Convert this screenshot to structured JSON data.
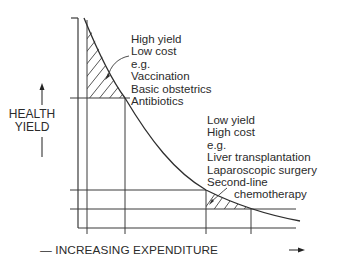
{
  "diagram": {
    "type": "cost-effectiveness curve",
    "y_axis_label_line1": "HEALTH",
    "y_axis_label_line2": "YIELD",
    "x_axis_label": "INCREASING EXPENDITURE",
    "x_axis_prefix": "—",
    "high_yield_box": {
      "lines": [
        "High yield",
        "Low cost",
        "e.g.",
        "Vaccination",
        "Basic obstetrics",
        "Antibiotics"
      ]
    },
    "low_yield_box": {
      "lines": [
        "Low yield",
        "High cost",
        "e.g.",
        "Liver transplantation",
        "Laparoscopic surgery",
        "Second-line",
        "chemotherapy"
      ]
    },
    "colors": {
      "line": "#333333",
      "text": "#2b2b2b",
      "background": "#ffffff"
    }
  }
}
